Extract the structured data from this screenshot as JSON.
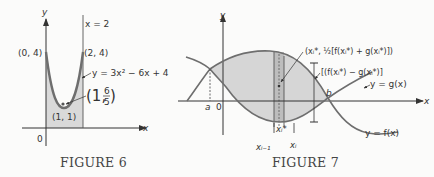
{
  "figures": [
    {
      "id": "figure6",
      "caption": "FIGURE 6",
      "axis_labels": {
        "x": "x",
        "y": "y",
        "origin": "0"
      },
      "vertical_line_label": "x = 2",
      "curve_label": "y = 3x² − 6x + 4",
      "points": [
        {
          "label": "(0, 4)"
        },
        {
          "label": "(2, 4)"
        },
        {
          "label": "(1, 1)"
        }
      ],
      "centroid": {
        "prefix": "(1,",
        "num": "6",
        "den": "5",
        "suffix": ")"
      }
    },
    {
      "id": "figure7",
      "caption": "FIGURE 7",
      "axis_labels": {
        "x": "x",
        "y": "y",
        "origin": "0"
      },
      "bounds": {
        "a": "a",
        "b": "b"
      },
      "curve_labels": {
        "g": "y = g(x)",
        "f": "y = f(x)"
      },
      "strip_labels": {
        "midpoint": "(xᵢ*, ½[f(xᵢ*) + g(xᵢ*)])",
        "height": "[(f(xᵢ*) − g(xᵢ*)]",
        "sample": "xᵢ*",
        "left": "xᵢ₋₁",
        "right": "xᵢ"
      }
    }
  ],
  "colors": {
    "curve": "#6e6e6e",
    "fill": "#d6d6d6",
    "strip": "#bdbdbd",
    "axis": "#333333",
    "background": "#fbfbfa"
  }
}
